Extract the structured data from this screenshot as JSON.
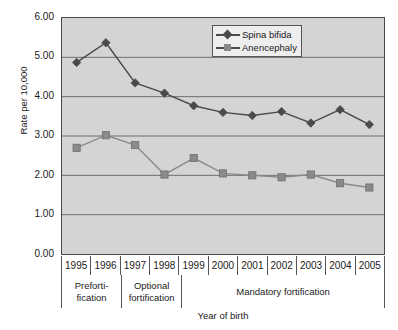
{
  "chart_data": {
    "type": "line",
    "title": "",
    "xlabel": "Year of birth",
    "ylabel": "Rate per 10,000",
    "categories": [
      "1995",
      "1996",
      "1997",
      "1998",
      "1999",
      "2000",
      "2001",
      "2002",
      "2003",
      "2004",
      "2005"
    ],
    "ylim": [
      0,
      6
    ],
    "yticks": [
      "0.00",
      "1.00",
      "2.00",
      "3.00",
      "4.00",
      "5.00",
      "6.00"
    ],
    "ytick_values": [
      0,
      1,
      2,
      3,
      4,
      5,
      6
    ],
    "grid": true,
    "legend_position": "top-right",
    "series": [
      {
        "name": "Spina bifida",
        "marker": "diamond",
        "color": "#4a4a4a",
        "values": [
          4.87,
          5.37,
          4.35,
          4.09,
          3.77,
          3.6,
          3.52,
          3.62,
          3.33,
          3.67,
          3.29
        ]
      },
      {
        "name": "Anencephaly",
        "marker": "square",
        "color": "#8a8a8a",
        "values": [
          2.7,
          3.02,
          2.77,
          2.02,
          2.44,
          2.05,
          2.0,
          1.95,
          2.02,
          1.8,
          1.69
        ]
      }
    ],
    "x_groups": [
      {
        "label": "Preforti-\nfication",
        "line1": "Preforti-",
        "line2": "fication",
        "span": 2
      },
      {
        "label": "Optional\nfortification",
        "line1": "Optional",
        "line2": "fortification",
        "span": 2
      },
      {
        "label": "Mandatory fortification",
        "line1": "Mandatory fortification",
        "line2": "",
        "span": 7
      }
    ],
    "colors": {
      "plot_background": "#d4d4d4",
      "axis": "#4a4a4a",
      "gridline": "#6e6e6e",
      "series1": "#4a4a4a",
      "series2": "#8a8a8a"
    }
  },
  "legend": {
    "items": [
      {
        "label": "Spina bifida"
      },
      {
        "label": "Anencephaly"
      }
    ]
  }
}
